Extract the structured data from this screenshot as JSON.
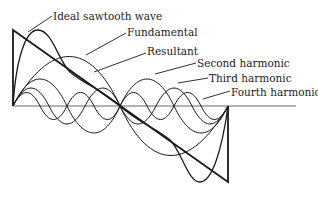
{
  "diagram": {
    "labels": {
      "ideal": "Ideal sawtooth wave",
      "fundamental": "Fundamental",
      "resultant": "Resultant",
      "second": "Second harmonic",
      "third": "Third harmonic",
      "fourth": "Fourth harmonic"
    },
    "colors": {
      "line": "#1a1a1a",
      "axis": "#555555",
      "background": "#ffffff"
    }
  }
}
